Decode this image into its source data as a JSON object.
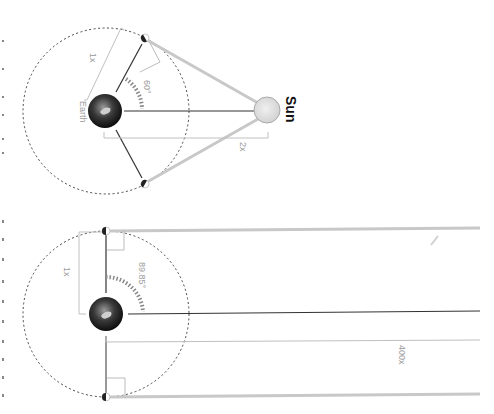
{
  "diagrams": [
    {
      "id": "near-sun",
      "labels": {
        "sun": "Sun",
        "earth": "Earth",
        "moon_distance": "1x",
        "sun_distance": "2x",
        "angle": "60°"
      }
    },
    {
      "id": "far-sun",
      "labels": {
        "moon_distance": "1x",
        "sun_distance": "400x",
        "angle": "89.85°"
      }
    }
  ],
  "colors": {
    "sunlight": "#c8c8c8",
    "sight_line": "#333333",
    "bracket": "#c0c0c0",
    "orbit": "#444444",
    "sun_fill": "#e2e2e2",
    "label": "#9a9a9a"
  }
}
